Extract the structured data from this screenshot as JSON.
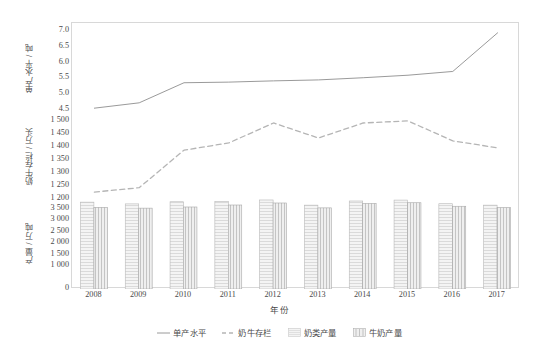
{
  "chart_data": {
    "type": "line",
    "title": "",
    "subtitle": "",
    "xlabel": "年份",
    "x": [
      2008,
      2009,
      2010,
      2011,
      2012,
      2013,
      2014,
      2015,
      2016,
      2017
    ],
    "xtick_labels": [
      "2008",
      "2009",
      "2010",
      "2011",
      "2012",
      "2013",
      "2014",
      "2015",
      "2016",
      "2017"
    ],
    "grid": false,
    "legend_position": "bottom",
    "panels": [
      {
        "name": "yield-panel",
        "ylabel": "单产水平 / 吨",
        "ylim": [
          4.3,
          7.2
        ],
        "ytick_values": [
          4.5,
          5.0,
          5.5,
          6.0,
          6.5,
          7.0
        ],
        "ytick_labels": [
          "4.5",
          "5.0",
          "5.5",
          "6.0",
          "6.5",
          "7.0"
        ],
        "series": [
          {
            "name": "单产水平",
            "type": "line",
            "style": "solid",
            "color": "#9a9a9a",
            "unit": "吨",
            "values": [
              4.55,
              4.72,
              5.36,
              5.38,
              5.42,
              5.45,
              5.52,
              5.6,
              5.72,
              6.95
            ]
          }
        ]
      },
      {
        "name": "stock-panel",
        "ylabel": "奶牛存栏 / 万头",
        "ylim": [
          1180,
          1520
        ],
        "ytick_values": [
          1200,
          1250,
          1300,
          1350,
          1400,
          1450,
          1500
        ],
        "ytick_labels": [
          "1 200",
          "1 250",
          "1 300",
          "1 350",
          "1 400",
          "1 450",
          "1 500"
        ],
        "series": [
          {
            "name": "奶牛存栏",
            "type": "line",
            "style": "dashed",
            "color": "#b5b5b5",
            "unit": "万头",
            "values": [
              1226,
              1243,
              1388,
              1416,
              1493,
              1435,
              1493,
              1501,
              1424,
              1397
            ]
          }
        ]
      },
      {
        "name": "output-panel",
        "ylabel": "产量 / 万吨",
        "ylim": [
          0,
          3700
        ],
        "ytick_values": [
          0,
          1000,
          1500,
          2000,
          2500,
          3000,
          3500
        ],
        "ytick_labels": [
          "0",
          "1 000",
          "1 500",
          "2 000",
          "2 500",
          "3 000",
          "3 500"
        ],
        "series": [
          {
            "name": "奶类产量",
            "type": "bar",
            "pattern": "horizontal-hatch",
            "color": "#f2f2f2",
            "edge": "#b8b8b8",
            "unit": "万吨",
            "values": [
              3781,
              3705,
              3798,
              3810,
              3875,
              3650,
              3830,
              3870,
              3712,
              3650
            ]
          },
          {
            "name": "牛奶产量",
            "type": "bar",
            "pattern": "vertical-hatch",
            "color": "#ededed",
            "edge": "#a8a8a8",
            "unit": "万吨",
            "values": [
              3555,
              3520,
              3570,
              3656,
              3744,
              3531,
              3725,
              3755,
              3602,
              3545
            ]
          }
        ]
      }
    ],
    "legend": [
      {
        "label": "单产水平",
        "marker": "line-solid"
      },
      {
        "label": "奶牛存栏",
        "marker": "line-dashed"
      },
      {
        "label": "奶类产量",
        "marker": "bar-horizontal-hatch"
      },
      {
        "label": "牛奶产量",
        "marker": "bar-vertical-hatch"
      }
    ]
  },
  "colors": {
    "frame": "#d8d8d8",
    "text": "#4a4a4a",
    "line_solid": "#9a9a9a",
    "line_dashed": "#b5b5b5",
    "bar_fill_a": "#f2f2f2",
    "bar_fill_b": "#ededed",
    "background": "#ffffff"
  }
}
